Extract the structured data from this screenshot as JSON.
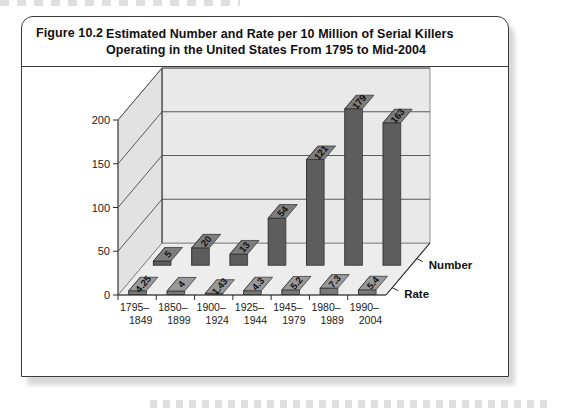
{
  "figure": {
    "number": "Figure 10.2",
    "title": "Estimated Number and Rate per 10 Million of Serial Killers Operating in the United States From 1795 to Mid-2004"
  },
  "chart_data": {
    "type": "bar",
    "render": "3d-grouped-bar",
    "title": "Estimated Number and Rate per 10 Million of Serial Killers Operating in the United States From 1795 to Mid-2004",
    "xlabel": "",
    "ylabel": "",
    "ylim": [
      0,
      200
    ],
    "yticks": [
      0,
      50,
      100,
      150,
      200
    ],
    "ytick_labels": [
      "0",
      "50",
      "100",
      "150",
      "200"
    ],
    "grid": true,
    "legend_position": "depth-axis-right",
    "categories": [
      "1795–1849",
      "1850–1899",
      "1900–1924",
      "1925–1944",
      "1945–1979",
      "1980–1989",
      "1990–2004"
    ],
    "category_lines": [
      [
        "1795–",
        "1849"
      ],
      [
        "1850–",
        "1899"
      ],
      [
        "1900–",
        "1924"
      ],
      [
        "1925–",
        "1944"
      ],
      [
        "1945–",
        "1979"
      ],
      [
        "1980–",
        "1989"
      ],
      [
        "1990–",
        "2004"
      ]
    ],
    "series": [
      {
        "name": "Number",
        "values": [
          5,
          20,
          13,
          54,
          121,
          179,
          163
        ],
        "labels": [
          "5",
          "20",
          "13",
          "54",
          "121",
          "179",
          "163"
        ],
        "color": "#6e6e6e"
      },
      {
        "name": "Rate",
        "values": [
          4.25,
          4,
          1.43,
          4.3,
          5.2,
          7.3,
          5.4
        ],
        "labels": [
          "4.25",
          "4",
          "1.43",
          "4.3",
          "5.2",
          "7.3",
          "5.4"
        ],
        "color": "#8a8a8a"
      }
    ]
  },
  "colors": {
    "frame_border": "#3a3a3a",
    "wall_back": "#e9e9e9",
    "wall_left": "#e2e2e2",
    "floor": "#ededed",
    "gridline": "#4a4a4a",
    "bar_number": "#6e6e6e",
    "bar_rate": "#8a8a8a",
    "text": "#101010"
  }
}
